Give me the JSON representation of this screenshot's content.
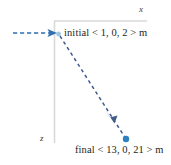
{
  "figure": {
    "background_color": "#ffffff",
    "axes": {
      "x_label": "x",
      "z_label": "z",
      "axis_color": "#d9d9d9",
      "horizontal": {
        "x1": 54,
        "y1": 21,
        "x2": 147,
        "y2": 21
      },
      "vertical": {
        "x1": 54,
        "y1": 21,
        "x2": 54,
        "y2": 143
      }
    },
    "incoming_arrow": {
      "name": "incoming-dashed-arrow",
      "color": "#2f6fb0",
      "style": "dashed",
      "x1": 13,
      "y1": 33,
      "x2": 57,
      "y2": 33
    },
    "displacement_arrow": {
      "name": "displacement-dashed-arrow",
      "color": "#3f5d8a",
      "style": "dashed",
      "x1": 60,
      "y1": 36,
      "x2": 126,
      "y2": 139,
      "midpoint_arrowhead": {
        "x": 112,
        "y": 119
      }
    },
    "points": [
      {
        "name": "initial-point",
        "label": "initial < 1, 0, 2 > m",
        "x": 58,
        "y": 34,
        "color": "#9ec6e0",
        "radius": 2.4
      },
      {
        "name": "final-point",
        "label": "final < 13, 0, 21 > m",
        "x": 126,
        "y": 139,
        "color": "#2f7fc1",
        "radius": 3.2
      }
    ]
  }
}
